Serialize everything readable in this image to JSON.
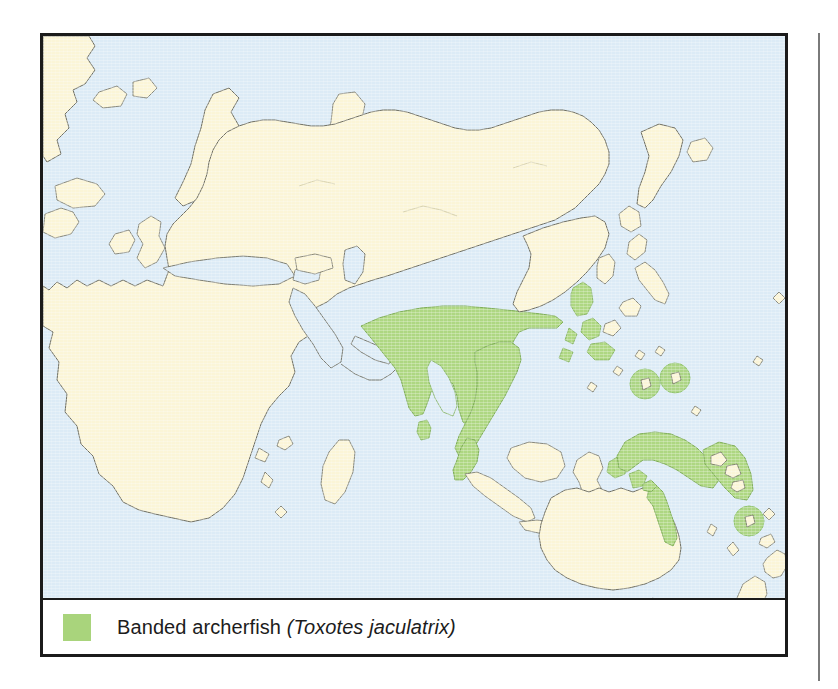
{
  "figure": {
    "type": "species-distribution-map",
    "projection_region": "Eastern Hemisphere / Indo-Pacific"
  },
  "legend": {
    "swatch_name": "range-swatch",
    "common_name": "Banded archerfish",
    "scientific_name": "(Toxotes jaculatrix)",
    "full_label": "Banded archerfish (Toxotes jaculatrix)"
  },
  "colors": {
    "ocean": "#dcebf6",
    "land": "#fbf5d7",
    "range": "#aed782",
    "range_marker": "#a9d47c",
    "coastline": "#6f6f63",
    "frame": "#1b1b1b",
    "legend_background": "#ffffff",
    "rule": "#7a7a7a"
  },
  "map": {
    "ocean_label": "ocean",
    "land_label": "landmass",
    "range_label": "banded-archerfish-range",
    "regions_shown": [
      "Greenland",
      "Iceland",
      "Scandinavia",
      "British Isles",
      "Europe",
      "Africa",
      "Madagascar",
      "Arabian Peninsula",
      "Russia",
      "Novaya Zemlya",
      "India",
      "Sri Lanka",
      "Southeast Asia",
      "Indochina",
      "China",
      "Korea",
      "Japan",
      "Philippines",
      "Borneo",
      "Sumatra",
      "Java",
      "Sulawesi",
      "New Guinea",
      "Solomon Islands",
      "Australia",
      "Tasmania",
      "New Zealand"
    ],
    "range_regions": [
      "Indian subcontinent coast",
      "Sri Lanka",
      "Bay of Bengal coast",
      "Indochina",
      "Malay Peninsula",
      "Philippines archipelago",
      "Indonesian islands",
      "New Guinea",
      "Solomon Islands",
      "Northeastern Australia (Cape York / Queensland coast)",
      "Western Micronesia",
      "Vanuatu"
    ]
  }
}
